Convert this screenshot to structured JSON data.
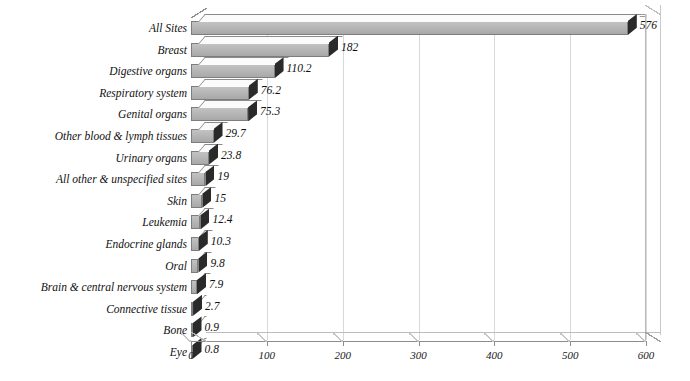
{
  "chart_data": {
    "type": "bar",
    "orientation": "horizontal",
    "title": "",
    "xlabel": "",
    "ylabel": "",
    "xlim": [
      0,
      600
    ],
    "xticks": [
      0,
      100,
      200,
      300,
      400,
      500,
      600
    ],
    "grid": true,
    "legend": "none",
    "style": "3d-horizontal-bar",
    "categories": [
      "All Sites",
      "Breast",
      "Digestive organs",
      "Respiratory system",
      "Genital organs",
      "Other blood & lymph tissues",
      "Urinary organs",
      "All other & unspecified sites",
      "Skin",
      "Leukemia",
      "Endocrine glands",
      "Oral",
      "Brain & central nervous system",
      "Connective tissue",
      "Bone",
      "Eye"
    ],
    "values": [
      576,
      182,
      110.2,
      76.2,
      75.3,
      29.7,
      23.8,
      19,
      15,
      12.4,
      10.3,
      9.8,
      7.9,
      2.7,
      0.9,
      0.8
    ],
    "value_labels": [
      "576",
      "182",
      "110.2",
      "76.2",
      "75.3",
      "29.7",
      "23.8",
      "19",
      "15",
      "12.4",
      "10.3",
      "9.8",
      "7.9",
      "2.7",
      "0.9",
      "0.8"
    ]
  },
  "colors": {
    "bar_front": "#b0b0b0",
    "bar_top": "#fbfbfb",
    "bar_cap": "#2a2a2a",
    "grid": "#d8d8d8",
    "axis": "#8d8d8d",
    "text": "#111111"
  }
}
